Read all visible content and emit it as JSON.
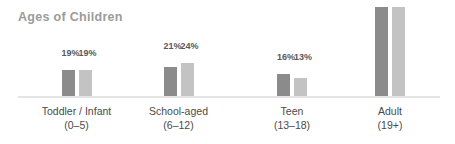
{
  "chart_data": {
    "type": "bar",
    "title": "Ages of Children",
    "xlabel": "",
    "ylabel": "",
    "ylim": [
      0,
      70
    ],
    "grid": false,
    "legend": "none",
    "categories": [
      "Toddler / Infant (0–5)",
      "School-aged (6–12)",
      "Teen (13–18)",
      "Adult (19+)"
    ],
    "series": [
      {
        "name": "series-a",
        "color": "#8b8b8b",
        "values": [
          19,
          21,
          16,
          65
        ]
      },
      {
        "name": "series-b",
        "color": "#c3c3c3",
        "values": [
          19,
          24,
          13,
          65
        ]
      }
    ],
    "value_suffix": "%"
  },
  "title": "Ages of Children",
  "groups": [
    {
      "line1": "Toddler / Infant",
      "line2": "(0–5)",
      "a_value": 19,
      "b_value": 19,
      "a_label": "19%",
      "b_label": "19%"
    },
    {
      "line1": "School-aged",
      "line2": "(6–12)",
      "a_value": 21,
      "b_value": 24,
      "a_label": "21%",
      "b_label": "24%"
    },
    {
      "line1": "Teen",
      "line2": "(13–18)",
      "a_value": 16,
      "b_value": 13,
      "a_label": "16%",
      "b_label": "13%"
    },
    {
      "line1": "Adult",
      "line2": "(19+)",
      "a_value": 65,
      "b_value": 65,
      "a_label": "65%",
      "b_label": "65%"
    }
  ],
  "colors": {
    "series_a": "#8b8b8b",
    "series_b": "#c3c3c3",
    "title": "#9b9b9b",
    "axis": "#e3e3e3",
    "category_text": "#4a4a4a",
    "value_text": "#58595b",
    "background": "#ffffff"
  }
}
